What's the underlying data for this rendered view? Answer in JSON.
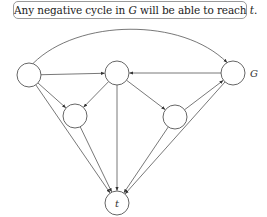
{
  "caption": {
    "prefix": "Any negative cycle in ",
    "graph_symbol": "G",
    "middle": " will be able to reach ",
    "target_symbol": "t",
    "suffix": "."
  },
  "graph": {
    "label": "G",
    "nodes": [
      {
        "id": "L",
        "label": "",
        "cx": 29,
        "cy": 75,
        "r": 12
      },
      {
        "id": "M",
        "label": "",
        "cx": 117,
        "cy": 73,
        "r": 12
      },
      {
        "id": "R",
        "label": "",
        "cx": 233,
        "cy": 73,
        "r": 12
      },
      {
        "id": "LL",
        "label": "",
        "cx": 75,
        "cy": 116,
        "r": 12
      },
      {
        "id": "LR",
        "label": "",
        "cx": 175,
        "cy": 117,
        "r": 12
      },
      {
        "id": "t",
        "label": "t",
        "cx": 117,
        "cy": 203,
        "r": 12
      }
    ],
    "edges": [
      {
        "from": "L",
        "to": "R",
        "curved": true
      },
      {
        "from": "L",
        "to": "M"
      },
      {
        "from": "R",
        "to": "M"
      },
      {
        "from": "L",
        "to": "LL"
      },
      {
        "from": "M",
        "to": "LL"
      },
      {
        "from": "M",
        "to": "LR"
      },
      {
        "from": "LR",
        "to": "R"
      },
      {
        "from": "L",
        "to": "t"
      },
      {
        "from": "LL",
        "to": "t"
      },
      {
        "from": "M",
        "to": "t"
      },
      {
        "from": "LR",
        "to": "t"
      },
      {
        "from": "R",
        "to": "t"
      }
    ]
  }
}
